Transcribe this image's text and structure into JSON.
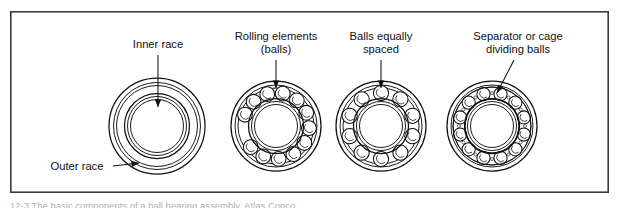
{
  "figure": {
    "frame": {
      "x": 10,
      "y": 11,
      "width": 599,
      "height": 182,
      "border_color": "#3a3a3a",
      "background": "#ffffff"
    },
    "caption": "12-3  The basic components of a ball bearing assembly. Atlas Copco",
    "ink_color": "#101010"
  },
  "labels": [
    {
      "id": "inner-race",
      "text": "Inner race",
      "lines": [
        "Inner race"
      ],
      "x": 158,
      "y": 48,
      "leader": "vertical-arrow-down",
      "arrow_target_x": 158,
      "arrow_target_y": 107
    },
    {
      "id": "outer-race",
      "text": "Outer race",
      "lines": [
        "Outer race"
      ],
      "x": 77,
      "y": 170,
      "leader": "horizontal-arrow-right",
      "arrow_target_x": 139,
      "arrow_target_y": 163
    },
    {
      "id": "rolling-elements",
      "text": "Rolling elements (balls)",
      "lines": [
        "Rolling elements",
        "(balls)"
      ],
      "x": 276,
      "y": 40,
      "leader": "vertical-arrow-down",
      "arrow_target_x": 276,
      "arrow_target_y": 88
    },
    {
      "id": "balls-equally-spaced",
      "text": "Balls equally spaced",
      "lines": [
        "Balls equally",
        "spaced"
      ],
      "x": 381,
      "y": 40,
      "leader": "vertical-arrow-down",
      "arrow_target_x": 381,
      "arrow_target_y": 88
    },
    {
      "id": "separator-cage",
      "text": "Separator or cage dividing balls",
      "lines": [
        "Separator or cage",
        "dividing balls"
      ],
      "x": 518,
      "y": 40,
      "leader": "diagonal-arrow-down-left",
      "arrow_target_x": 497,
      "arrow_target_y": 93
    }
  ],
  "bearings": [
    {
      "id": "bearing-races-only",
      "name": "races-only",
      "caption_ref": "inner-race",
      "cx": 157,
      "cy": 126,
      "outer_r": 48,
      "outer_inner_r": 42,
      "inner_r": 32,
      "inner_inner_r": 26,
      "ball_count": 0,
      "has_cage": false
    },
    {
      "id": "bearing-with-balls",
      "name": "balls-packed",
      "caption_ref": "rolling-elements",
      "cx": 276,
      "cy": 126,
      "outer_r": 45,
      "outer_inner_r": 39,
      "inner_r": 27,
      "inner_inner_r": 22,
      "ball_count": 12,
      "ball_r": 7.4,
      "ball_orbit_r": 33,
      "ball_arc_start_deg": 200,
      "ball_arc_span_deg": 300,
      "has_cage": false
    },
    {
      "id": "bearing-balls-spaced",
      "name": "balls-equally-spaced",
      "caption_ref": "balls-equally-spaced",
      "cx": 381,
      "cy": 126,
      "outer_r": 45,
      "outer_inner_r": 39,
      "inner_r": 27,
      "inner_inner_r": 22,
      "ball_count": 10,
      "ball_r": 7.6,
      "ball_orbit_r": 33,
      "has_cage": false
    },
    {
      "id": "bearing-with-cage",
      "name": "balls-in-cage",
      "caption_ref": "separator-cage",
      "cx": 492,
      "cy": 126,
      "outer_r": 45,
      "outer_inner_r": 39,
      "inner_r": 27,
      "inner_inner_r": 22,
      "ball_count": 12,
      "ball_r": 6.6,
      "ball_orbit_r": 33,
      "has_cage": true,
      "cage_outer_r": 39,
      "cage_inner_r": 27
    }
  ]
}
